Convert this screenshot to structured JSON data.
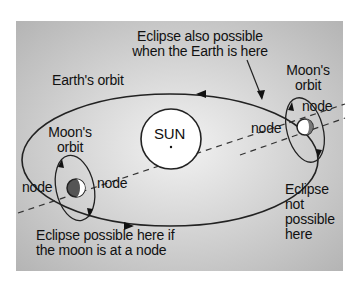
{
  "diagram": {
    "colors": {
      "panel_bg": "#c8c8c8",
      "line": "#222222",
      "sun_fill": "#ffffff"
    },
    "labels": {
      "eclipse_also": "Eclipse also possible\nwhen the Earth is here",
      "earths_orbit": "Earth's orbit",
      "moons_orbit_right": "Moon's\norbit",
      "moons_orbit_left": "Moon's\norbit",
      "sun": "SUN",
      "node_right_top": "node",
      "node_right_left": "node",
      "node_left_left": "node",
      "node_left_right": "node",
      "eclipse_not_possible": "Eclipse\nnot\npossible\nhere",
      "eclipse_possible": "Eclipse possible here if\nthe moon is at a node"
    }
  }
}
